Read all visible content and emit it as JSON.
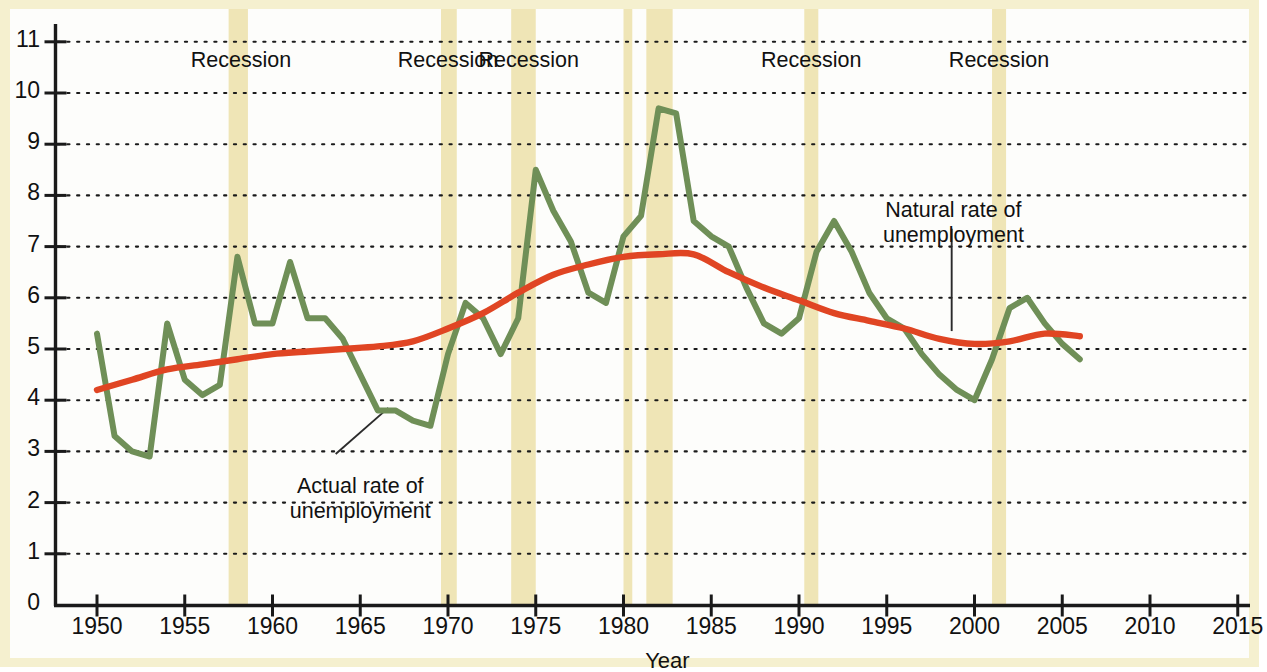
{
  "chart_data": {
    "type": "line",
    "title": "",
    "xlabel": "Year",
    "ylabel": "",
    "xlim": [
      1948.7,
      2016.5
    ],
    "ylim": [
      0,
      11.3
    ],
    "xticks": [
      1950,
      1955,
      1960,
      1965,
      1970,
      1975,
      1980,
      1985,
      1990,
      1995,
      2000,
      2005,
      2010,
      2015
    ],
    "xtick_labels": [
      "1950",
      "1955",
      "1960",
      "1965",
      "1970",
      "1975",
      "1980",
      "1985",
      "1990",
      "1995",
      "2000",
      "2005",
      "2010",
      "2015"
    ],
    "yticks": [
      0,
      1,
      2,
      3,
      4,
      5,
      6,
      7,
      8,
      9,
      10,
      11
    ],
    "ytick_labels": [
      "0",
      "1",
      "2",
      "3",
      "4",
      "5",
      "6",
      "7",
      "8",
      "9",
      "10",
      "11"
    ],
    "grid": "horizontal-dotted",
    "legend": "none",
    "series": [
      {
        "name": "Actual rate of unemployment",
        "color": "#6f8f57",
        "x": [
          1950,
          1951,
          1952,
          1953,
          1954,
          1955,
          1956,
          1957,
          1958,
          1959,
          1960,
          1961,
          1962,
          1963,
          1964,
          1965,
          1966,
          1967,
          1968,
          1969,
          1970,
          1971,
          1972,
          1973,
          1974,
          1975,
          1976,
          1977,
          1978,
          1979,
          1980,
          1981,
          1982,
          1983,
          1984,
          1985,
          1986,
          1987,
          1988,
          1989,
          1990,
          1991,
          1992,
          1993,
          1994,
          1995,
          1996,
          1997,
          1998,
          1999,
          2000,
          2001,
          2002,
          2003,
          2004,
          2005,
          2006
        ],
        "values": [
          5.3,
          3.3,
          3.0,
          2.9,
          5.5,
          4.4,
          4.1,
          4.3,
          6.8,
          5.5,
          5.5,
          6.7,
          5.6,
          5.6,
          5.2,
          4.5,
          3.8,
          3.8,
          3.6,
          3.5,
          4.9,
          5.9,
          5.6,
          4.9,
          5.6,
          8.5,
          7.7,
          7.1,
          6.1,
          5.9,
          7.2,
          7.6,
          9.7,
          9.6,
          7.5,
          7.2,
          7.0,
          6.2,
          5.5,
          5.3,
          5.6,
          6.9,
          7.5,
          6.9,
          6.1,
          5.6,
          5.4,
          4.9,
          4.5,
          4.2,
          4.0,
          4.8,
          5.8,
          6.0,
          5.5,
          5.1,
          4.8
        ]
      },
      {
        "name": "Natural rate of unemployment",
        "color": "#e04523",
        "x": [
          1950,
          1952,
          1954,
          1956,
          1958,
          1960,
          1962,
          1964,
          1966,
          1968,
          1970,
          1972,
          1974,
          1976,
          1978,
          1980,
          1982,
          1984,
          1986,
          1988,
          1990,
          1992,
          1994,
          1996,
          1998,
          2000,
          2002,
          2004,
          2006
        ],
        "values": [
          4.2,
          4.4,
          4.6,
          4.7,
          4.8,
          4.9,
          4.95,
          5.0,
          5.05,
          5.15,
          5.4,
          5.7,
          6.1,
          6.45,
          6.65,
          6.8,
          6.85,
          6.85,
          6.5,
          6.2,
          5.95,
          5.7,
          5.55,
          5.4,
          5.2,
          5.1,
          5.15,
          5.3,
          5.25
        ]
      }
    ],
    "shaded_regions": {
      "label": "Recession",
      "color": "#efe5b6",
      "bands": [
        {
          "start": 1957.5,
          "end": 1958.6
        },
        {
          "start": 1969.6,
          "end": 1970.5
        },
        {
          "start": 1973.6,
          "end": 1975.0
        },
        {
          "start": 1980.0,
          "end": 1980.5
        },
        {
          "start": 1981.3,
          "end": 1982.8
        },
        {
          "start": 1990.3,
          "end": 1991.1
        },
        {
          "start": 2001.0,
          "end": 2001.8
        }
      ],
      "band_labels": [
        {
          "text": "Recession",
          "x": 1958.2
        },
        {
          "text": "Recession",
          "x": 1970.0
        },
        {
          "text": "Recession",
          "x": 1974.6
        },
        {
          "text": "Recession",
          "x": 1990.7
        },
        {
          "text": "Recession",
          "x": 2001.4
        }
      ]
    },
    "annotations": [
      {
        "id": "actual-rate-annotation",
        "lines": [
          "Actual rate of",
          "unemployment"
        ],
        "text_x": 1965.0,
        "text_y": 2.55,
        "leader_from": [
          1963.6,
          2.95
        ],
        "leader_to": [
          1966.6,
          3.85
        ]
      },
      {
        "id": "natural-rate-annotation",
        "lines": [
          "Natural rate of",
          "unemployment"
        ],
        "text_x": 1998.8,
        "text_y": 7.95,
        "leader_from": [
          1998.7,
          7.35
        ],
        "leader_to": [
          1998.7,
          5.35
        ]
      }
    ]
  },
  "axis": {
    "x_title": "Year"
  }
}
